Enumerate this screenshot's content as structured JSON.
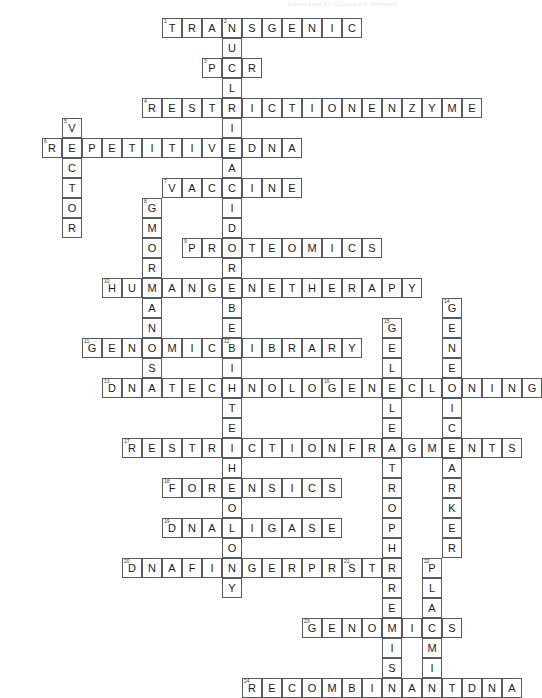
{
  "page": {
    "header_note": "Generated by Crossword Hobbyist"
  },
  "grid": {
    "cell_size": 20,
    "origin_x": 22,
    "origin_y": 18,
    "cols": 24,
    "rows": 28,
    "border_color": "#555b5e",
    "cell_fill": "#ffffff",
    "letter_color": "#1b1b1b",
    "number_color": "#3a3a3a"
  },
  "entries": [
    {
      "number": 1,
      "answer": "TRANSGENIC",
      "direction": "across",
      "row": 0,
      "col": 7
    },
    {
      "number": 2,
      "answer": "NUCLEICACIDPROBE",
      "direction": "down",
      "row": 0,
      "col": 10
    },
    {
      "number": 3,
      "answer": "PCR",
      "direction": "across",
      "row": 2,
      "col": 9
    },
    {
      "number": 4,
      "answer": "RESTRICTIONENZYME",
      "direction": "across",
      "row": 4,
      "col": 6
    },
    {
      "number": 5,
      "answer": "VECTOR",
      "direction": "down",
      "row": 5,
      "col": 2
    },
    {
      "number": 6,
      "answer": "REPETITIVEDNA",
      "direction": "across",
      "row": 6,
      "col": 1
    },
    {
      "number": 7,
      "answer": "VACCINE",
      "direction": "across",
      "row": 8,
      "col": 7
    },
    {
      "number": 8,
      "answer": "GMORGANISM",
      "direction": "down",
      "row": 9,
      "col": 6
    },
    {
      "number": 9,
      "answer": "PROTEOMICS",
      "direction": "across",
      "row": 11,
      "col": 8
    },
    {
      "number": 10,
      "answer": "HUMANGENETHERAPY",
      "direction": "across",
      "row": 13,
      "col": 4
    },
    {
      "number": 11,
      "answer": "GENOMICLIBRARY",
      "direction": "across",
      "row": 16,
      "col": 3
    },
    {
      "number": 12,
      "answer": "BIOTECHNOLOGY",
      "direction": "down",
      "row": 16,
      "col": 10
    },
    {
      "number": 13,
      "answer": "DNATECHNOLOGY",
      "direction": "across",
      "row": 18,
      "col": 4
    },
    {
      "number": 14,
      "answer": "GENETICMARKER",
      "direction": "down",
      "row": 14,
      "col": 21
    },
    {
      "number": 15,
      "answer": "GELELECTROPHORESIS",
      "direction": "down",
      "row": 15,
      "col": 18
    },
    {
      "number": 16,
      "answer": "GENECLONING",
      "direction": "across",
      "row": 18,
      "col": 15
    },
    {
      "number": 17,
      "answer": "RESTRICTIONFRAGMENTS",
      "direction": "across",
      "row": 21,
      "col": 5
    },
    {
      "number": 18,
      "answer": "FORENSICS",
      "direction": "across",
      "row": 23,
      "col": 7
    },
    {
      "number": 19,
      "answer": "DNALIGASE",
      "direction": "across",
      "row": 25,
      "col": 7
    },
    {
      "number": 20,
      "answer": "DNAFINGERPRINT",
      "direction": "across",
      "row": 27,
      "col": 5
    },
    {
      "number": 21,
      "answer": "STR",
      "direction": "across",
      "row": 27,
      "col": 16
    },
    {
      "number": 22,
      "answer": "PLASMID",
      "direction": "down",
      "row": 27,
      "col": 20
    },
    {
      "number": 23,
      "answer": "GENOMICS",
      "direction": "across",
      "row": 30,
      "col": 14
    },
    {
      "number": 24,
      "answer": "RECOMBINANTDNA",
      "direction": "across",
      "row": 33,
      "col": 11
    }
  ]
}
